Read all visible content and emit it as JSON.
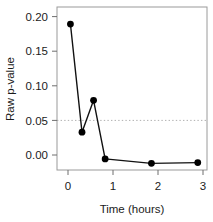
{
  "chart_data": {
    "type": "line",
    "title": "",
    "subtitle": "",
    "xlabel": "Time (hours)",
    "ylabel": "Raw p-value",
    "x": [
      0.25,
      0.5,
      0.75,
      1,
      2,
      3
    ],
    "values": [
      0.189,
      0.043,
      0.086,
      0.007,
      0.001,
      0.002
    ],
    "series": [
      {
        "name": "Raw p-value",
        "x": [
          0.25,
          0.5,
          0.75,
          1,
          2,
          3
        ],
        "values": [
          0.189,
          0.043,
          0.086,
          0.007,
          0.001,
          0.002
        ],
        "marker": "filled-circle",
        "color": "#000000"
      }
    ],
    "xlim": [
      -0.04,
      3.2
    ],
    "ylim": [
      -0.008,
      0.212
    ],
    "xticks": [
      0,
      1,
      2,
      3
    ],
    "xticklabels": [
      "0",
      "1",
      "2",
      "3"
    ],
    "yticks": [
      0.0,
      0.05,
      0.1,
      0.15,
      0.2
    ],
    "yticklabels": [
      "0.00",
      "0.05",
      "0.10",
      "0.15",
      "0.20"
    ],
    "grid": false,
    "legend": null,
    "reference_lines": [
      {
        "name": "significance-threshold",
        "orientation": "horizontal",
        "value": 0.05,
        "style": "dotted",
        "color": "#b0b0b0"
      }
    ],
    "annotations": [],
    "box_color": "#9a9a9a",
    "line_color": "#111111",
    "point_color": "#000000"
  }
}
